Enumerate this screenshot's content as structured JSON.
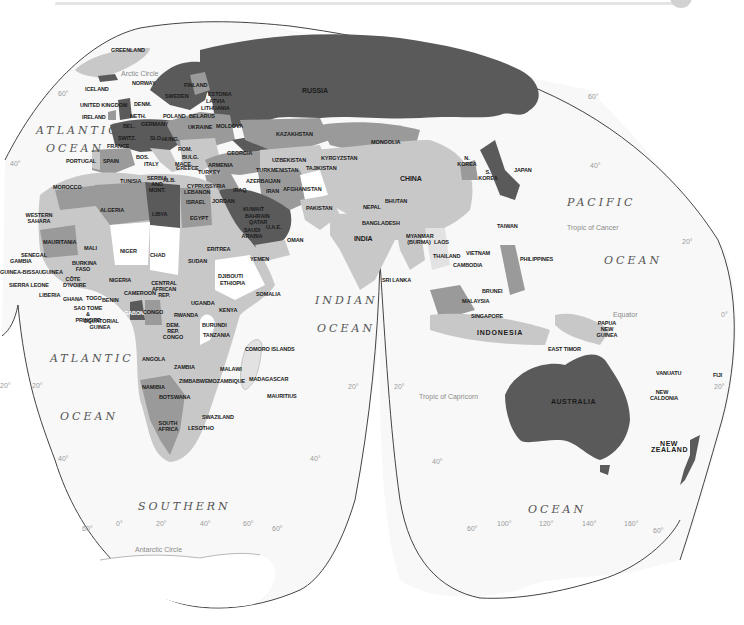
{
  "map": {
    "projection": "interrupted world map",
    "colors": {
      "ocean": "#f8f8f8",
      "outline": "#444444",
      "dark": "#5a5a5a",
      "medium": "#9a9a9a",
      "light": "#c8c8c8",
      "pale": "#e2e2e2",
      "white": "#ffffff"
    },
    "oceans": {
      "atlantic_north_1": "ATLANTIC",
      "atlantic_north_2": "OCEAN",
      "atlantic_south_1": "ATLANTIC",
      "atlantic_south_2": "OCEAN",
      "pacific_1": "PACIFIC",
      "pacific_2": "OCEAN",
      "indian_1": "INDIAN",
      "indian_2": "OCEAN",
      "southern": "SOUTHERN",
      "southern_ocean_2": "OCEAN"
    },
    "lines": {
      "arctic_circle": "Arctic Circle",
      "tropic_cancer": "Tropic of Cancer",
      "equator": "Equator",
      "tropic_capricorn": "Tropic of Capricorn",
      "antarctic_circle": "Antarctic Circle"
    },
    "graticule": {
      "lat_60_nw": "60°",
      "lat_40_w": "40°",
      "lat_20_w": "20°",
      "lat_20_a": "20°",
      "lat_40_sw": "40°",
      "lat_40_s_mid": "40°",
      "lat_20_mid_l": "20°",
      "lat_20_mid_r": "20°",
      "lat_40_s_aus": "40°",
      "lat_60_ne": "60°",
      "lat_40_ne": "40°",
      "lat_20_e": "20°",
      "lat_0_e": "0°",
      "lat_20_se": "20°",
      "lat_60_sw": "60°",
      "lon_0": "0°",
      "lon_20": "20°",
      "lon_40": "40°",
      "lon_60": "60°",
      "lat_60_s_mid": "60°",
      "lat_60_s_aus_l": "60°",
      "lon_100": "100°",
      "lon_120": "120°",
      "lon_140": "140°",
      "lon_160": "160°",
      "lat_60_s_aus_r": "60°"
    },
    "countries": {
      "greenland": "GREENLAND",
      "iceland": "ICELAND",
      "norway": "NORWAY",
      "finland": "FINLAND",
      "sweden": "SWEDEN",
      "estonia": "ESTONIA",
      "latvia": "LATVIA",
      "lithuania": "LITHUANIA",
      "united_kingdom": "UNITED KINGDOM",
      "denmark": "DENM.",
      "ireland": "IRELAND",
      "netherlands": "NETH.",
      "poland": "POLAND",
      "belarus": "BELARUS",
      "belgium": "BEL.",
      "germany": "GERMANY",
      "ukraine": "UKRAINE",
      "moldova": "MOLDOVA",
      "switzerland": "SWITZ.",
      "france": "FRANCE",
      "slovakia": "SLO.",
      "hungary": "HUNG.",
      "romania": "ROM.",
      "bosnia": "BOS.",
      "italy": "ITALY",
      "bulgaria": "BULG.",
      "macedonia": "MACE.",
      "greece": "GREECE",
      "portugal": "PORTUGAL",
      "spain": "SPAIN",
      "serbia": "SERBIA AND MONT.",
      "albania": "ALB.",
      "georgia": "GEORGIA",
      "armenia": "ARMENIA",
      "turkey": "TURKEY",
      "azerbaijan": "AZERBAIJAN",
      "cyprus": "CYPRUS",
      "lebanon": "LEBANON",
      "syria": "SYRIA",
      "iraq": "IRAQ",
      "israel": "ISRAEL",
      "jordan": "JORDAN",
      "kuwait": "KUWAIT",
      "bahrain": "BAHRAIN",
      "qatar": "QATAR",
      "saudi_arabia": "SAUDI ARABIA",
      "uae": "U.A.E.",
      "oman": "OMAN",
      "yemen": "YEMEN",
      "iran": "IRAN",
      "russia": "RUSSIA",
      "kazakhstan": "KAZAKHSTAN",
      "uzbekistan": "UZBEKISTAN",
      "kyrgyzstan": "KYRGYZSTAN",
      "turkmenistan": "TURKMENISTAN",
      "tajikistan": "TAJIKISTAN",
      "afghanistan": "AFGHANISTAN",
      "pakistan": "PAKISTAN",
      "mongolia": "MONGOLIA",
      "china": "CHINA",
      "n_korea": "N. KOREA",
      "s_korea": "S. KOREA",
      "japan": "JAPAN",
      "nepal": "NEPAL",
      "bhutan": "BHUTAN",
      "bangladesh": "BANGLADESH",
      "india": "INDIA",
      "sri_lanka": "SRI LANKA",
      "myanmar": "MYANMAR (BURMA)",
      "laos": "LAOS",
      "thailand": "THAILAND",
      "vietnam": "VIETNAM",
      "cambodia": "CAMBODIA",
      "taiwan": "TAIWAN",
      "philippines": "PHILIPPINES",
      "brunei": "BRUNEI",
      "malaysia": "MALAYSIA",
      "singapore": "SINGAPORE",
      "indonesia": "INDONESIA",
      "east_timor": "EAST TIMOR",
      "papua_new_guinea": "PAPUA NEW GUINEA",
      "australia": "AUSTRALIA",
      "new_zealand": "NEW ZEALAND",
      "vanuatu": "VANUATU",
      "new_caledonia": "NEW CALDONIA",
      "fiji": "FIJI",
      "morocco": "MOROCCO",
      "western_sahara": "WESTERN SAHARA",
      "algeria": "ALGERIA",
      "tunisia": "TUNISIA",
      "libya": "LIBYA",
      "egypt": "EGYPT",
      "mauritania": "MAURITANIA",
      "mali": "MALI",
      "niger": "NIGER",
      "chad": "CHAD",
      "sudan": "SUDAN",
      "eritrea": "ERITREA",
      "djibouti": "DJIBOUTI",
      "ethiopia": "ETHIOPIA",
      "somalia": "SOMALIA",
      "senegal": "SENEGAL",
      "gambia": "GAMBIA",
      "guinea_bissau": "GUINEA-BISSAU",
      "guinea": "GUINEA",
      "sierra_leone": "SIERRA LEONE",
      "liberia": "LIBERIA",
      "cote_divoire": "CÔTE D'IVOIRE",
      "burkina_faso": "BURKINA FASO",
      "ghana": "GHANA",
      "togo": "TOGO",
      "benin": "BENIN",
      "nigeria": "NIGERIA",
      "cameroon": "CAMEROON",
      "car": "CENTRAL AFRICAN REP.",
      "sao_tome": "SAO TOME & PRINCIPE",
      "equatorial_guinea": "EQUATORIAL GUINEA",
      "gabon": "GABON",
      "congo": "CONGO",
      "dem_rep_congo": "DEM. REP. CONGO",
      "uganda": "UGANDA",
      "kenya": "KENYA",
      "rwanda": "RWANDA",
      "burundi": "BURUNDI",
      "tanzania": "TANZANIA",
      "angola": "ANGOLA",
      "zambia": "ZAMBIA",
      "malawi": "MALAWI",
      "comoro": "COMORO ISLANDS",
      "namibia": "NAMIBIA",
      "zimbabwe": "ZIMBABWE",
      "mozambique": "MOZAMBIQUE",
      "madagascar": "MADAGASCAR",
      "mauritius": "MAURITIUS",
      "botswana": "BOTSWANA",
      "swaziland": "SWAZILAND",
      "south_africa": "SOUTH AFRICA",
      "lesotho": "LESOTHO"
    }
  }
}
